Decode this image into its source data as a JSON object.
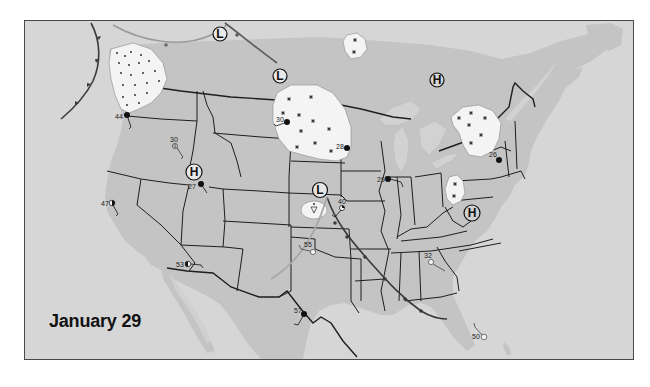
{
  "map": {
    "title": "January 29",
    "colors": {
      "ocean": "#d6d6d6",
      "land": "#c4c4c4",
      "mexico_lighter": "#cdcdcd",
      "precip_area": "#f4f4f4",
      "borders": "#1e1e1e",
      "cold_front": "#3a3a3a",
      "warm_front_faded": "#9a9a9a",
      "frame": "#4a4a4a"
    },
    "pressure_centers": [
      {
        "type": "L",
        "label": "L",
        "region": "southern Canada (north of Montana)"
      },
      {
        "type": "L",
        "label": "L",
        "region": "southern Manitoba"
      },
      {
        "type": "H",
        "label": "H",
        "region": "Ontario / Hudson Bay"
      },
      {
        "type": "H",
        "label": "H",
        "region": "Idaho / Utah"
      },
      {
        "type": "L",
        "label": "L",
        "region": "Kansas / Nebraska border"
      },
      {
        "type": "H",
        "label": "H",
        "region": "Virginia"
      }
    ],
    "precipitation_areas": [
      {
        "type": "rain",
        "region": "Pacific Northwest (Washington)"
      },
      {
        "type": "snow",
        "region": "Northern Plains (North Dakota / Minnesota)"
      },
      {
        "type": "snow",
        "region": "Northern Ontario"
      },
      {
        "type": "snow",
        "region": "Southern Quebec / New York"
      },
      {
        "type": "snow",
        "region": "West Virginia"
      },
      {
        "type": "showers",
        "region": "Kansas"
      }
    ],
    "stations": [
      {
        "temp": "44",
        "location": "Portland OR"
      },
      {
        "temp": "30",
        "location": "Boise ID"
      },
      {
        "temp": "27",
        "location": "Salt Lake City UT"
      },
      {
        "temp": "47",
        "location": "San Francisco CA"
      },
      {
        "temp": "53",
        "location": "Phoenix AZ"
      },
      {
        "temp": "30",
        "location": "Bismarck ND"
      },
      {
        "temp": "28",
        "location": "Minneapolis MN"
      },
      {
        "temp": "40",
        "location": "Kansas City MO"
      },
      {
        "temp": "55",
        "location": "Oklahoma City OK"
      },
      {
        "temp": "57",
        "location": "San Antonio TX"
      },
      {
        "temp": "29",
        "location": "Chicago IL"
      },
      {
        "temp": "32",
        "location": "Atlanta GA"
      },
      {
        "temp": "26",
        "location": "New York NY"
      },
      {
        "temp": "50",
        "location": "Miami FL"
      }
    ]
  }
}
